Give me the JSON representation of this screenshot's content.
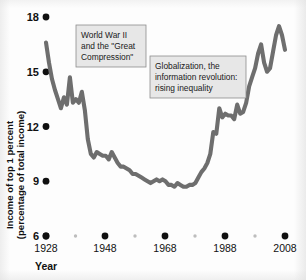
{
  "figure": {
    "background_color": "#fdfdfd",
    "line_color": "#6e6e6e",
    "tick_dot_color": "#101010",
    "minor_dot_color": "#bdbdbd",
    "annotation_fill": "#e7e7e7",
    "annotation_border": "#8d8d8d"
  },
  "axes": {
    "y_title_line1": "Income of top 1 percent",
    "y_title_line2": "(percentage of total income)",
    "x_title": "Year",
    "y_ticks": [
      "18",
      "15",
      "12",
      "9",
      "6"
    ],
    "y_tick_values": [
      18,
      15,
      12,
      9,
      6
    ],
    "x_ticks": [
      "1928",
      "1948",
      "1968",
      "1988",
      "2008"
    ],
    "x_tick_values": [
      1928,
      1948,
      1968,
      1988,
      2008
    ],
    "x_minor_values": [
      1938,
      1958,
      1978,
      1998
    ]
  },
  "annotations": [
    {
      "id": "annotation-wwii",
      "lines": [
        "World War II",
        "and the \"Great",
        "Compression\""
      ],
      "text": "World War II and the \"Great Compression\""
    },
    {
      "id": "annotation-globalization",
      "lines": [
        "Globalization, the",
        "information revolution:",
        "rising inequality"
      ],
      "text": "Globalization, the information revolution: rising inequality"
    }
  ],
  "chart_data": {
    "type": "line",
    "title": "",
    "xlabel": "Year",
    "ylabel": "Income of top 1 percent (percentage of total income)",
    "xlim": [
      1928,
      2008
    ],
    "ylim": [
      6,
      18
    ],
    "grid": false,
    "legend": "none",
    "series": [
      {
        "name": "Income share of top 1 percent",
        "color": "#6e6e6e",
        "x": [
          1928,
          1929,
          1930,
          1931,
          1932,
          1933,
          1934,
          1935,
          1936,
          1937,
          1938,
          1939,
          1940,
          1941,
          1942,
          1943,
          1944,
          1945,
          1946,
          1947,
          1948,
          1949,
          1950,
          1951,
          1952,
          1953,
          1954,
          1955,
          1956,
          1957,
          1958,
          1959,
          1960,
          1961,
          1962,
          1963,
          1964,
          1965,
          1966,
          1967,
          1968,
          1969,
          1970,
          1971,
          1972,
          1973,
          1974,
          1975,
          1976,
          1977,
          1978,
          1979,
          1980,
          1981,
          1982,
          1983,
          1984,
          1985,
          1986,
          1987,
          1988,
          1989,
          1990,
          1991,
          1992,
          1993,
          1994,
          1995,
          1996,
          1997,
          1998,
          1999,
          2000,
          2001,
          2002,
          2003,
          2004,
          2005,
          2006,
          2007,
          2008
        ],
        "y": [
          16.6,
          15.5,
          14.6,
          14.0,
          13.5,
          13.0,
          13.6,
          13.2,
          14.7,
          13.3,
          13.5,
          13.3,
          13.9,
          12.9,
          11.3,
          10.5,
          10.3,
          10.6,
          10.5,
          10.4,
          10.4,
          10.2,
          10.6,
          10.3,
          10.0,
          9.8,
          9.8,
          9.7,
          9.6,
          9.4,
          9.4,
          9.3,
          9.2,
          9.1,
          9.0,
          8.9,
          9.0,
          9.1,
          9.0,
          9.1,
          9.0,
          8.8,
          8.8,
          8.7,
          8.9,
          8.8,
          8.7,
          8.7,
          8.8,
          8.8,
          8.9,
          9.2,
          9.5,
          9.7,
          10.0,
          10.5,
          11.7,
          11.6,
          13.0,
          12.5,
          12.7,
          12.6,
          12.6,
          12.4,
          13.2,
          12.7,
          12.8,
          13.3,
          14.2,
          14.7,
          15.2,
          16.0,
          16.5,
          15.5,
          15.0,
          15.2,
          16.1,
          17.0,
          17.5,
          17.0,
          16.2
        ]
      }
    ]
  }
}
